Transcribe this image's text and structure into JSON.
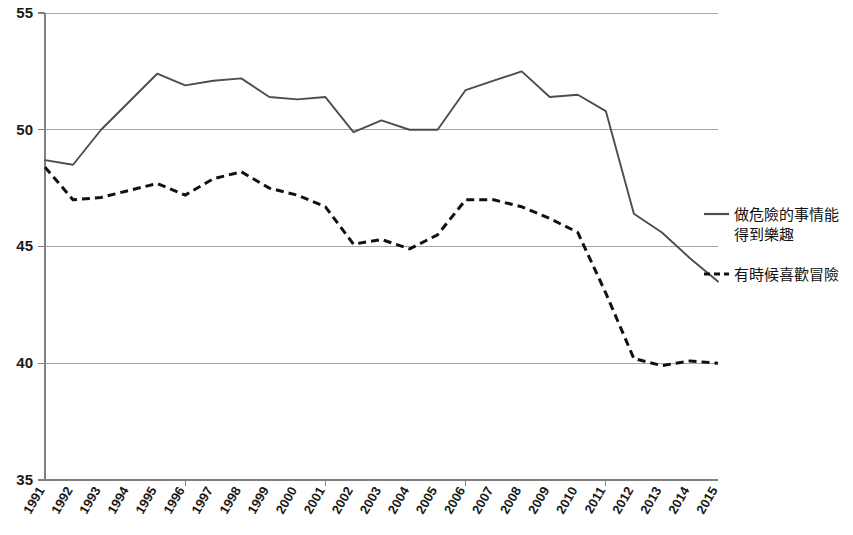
{
  "chart_data": {
    "type": "line",
    "title": "",
    "xlabel": "",
    "ylabel": "",
    "ylim": [
      35,
      55
    ],
    "ytick_values": [
      35,
      40,
      45,
      50,
      55
    ],
    "grid": "horizontal",
    "legend_position": "right",
    "categories": [
      "1991",
      "1992",
      "1993",
      "1994",
      "1995",
      "1996",
      "1997",
      "1998",
      "1999",
      "2000",
      "2001",
      "2002",
      "2003",
      "2004",
      "2005",
      "2006",
      "2007",
      "2008",
      "2009",
      "2010",
      "2011",
      "2012",
      "2013",
      "2014",
      "2015"
    ],
    "series": [
      {
        "name": "做危險的事情能得到樂趣",
        "style": "solid",
        "color": "#4d4d4d",
        "values": [
          48.7,
          48.5,
          50.0,
          51.2,
          52.4,
          51.9,
          52.1,
          52.2,
          51.4,
          51.3,
          51.4,
          49.9,
          50.4,
          50.0,
          50.0,
          51.7,
          52.1,
          52.5,
          51.4,
          51.5,
          50.8,
          46.4,
          45.6,
          44.5,
          43.5
        ]
      },
      {
        "name": "有時候喜歡冒險",
        "style": "dashed",
        "color": "#111111",
        "values": [
          48.4,
          47.0,
          47.1,
          47.4,
          47.7,
          47.2,
          47.9,
          48.2,
          47.5,
          47.2,
          46.7,
          45.1,
          45.3,
          44.9,
          45.5,
          47.0,
          47.0,
          46.7,
          46.2,
          45.6,
          43.0,
          40.2,
          39.9,
          40.1,
          40.0
        ]
      }
    ]
  },
  "legend": {
    "items": [
      {
        "label": "做危險的事情能得到樂趣",
        "style": "solid"
      },
      {
        "label": "有時候喜歡冒險",
        "style": "dashed"
      }
    ]
  }
}
